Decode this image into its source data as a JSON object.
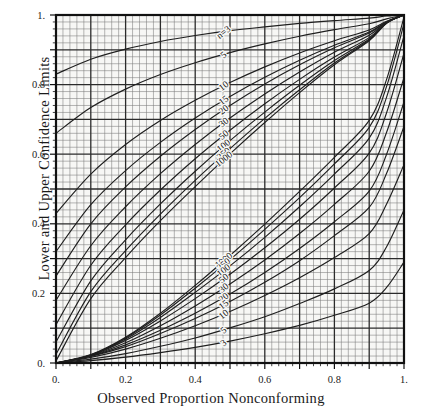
{
  "chart_data": {
    "type": "line",
    "title": "",
    "xlabel": "Observed Proportion Nonconforming",
    "ylabel": "Lower and Upper Confidence Limits",
    "xlim": [
      0,
      1
    ],
    "ylim": [
      0,
      1
    ],
    "grid": true,
    "grid_major_step": 0.1,
    "grid_minor_step": 0.02,
    "legend_position": "inline-curve-labels",
    "xticks": [
      0,
      0.2,
      0.4,
      0.6,
      0.8,
      1
    ],
    "yticks": [
      0,
      0.2,
      0.4,
      0.6,
      0.8,
      1
    ],
    "xticklabels": [
      "0.",
      "0.2",
      "0.4",
      "0.6",
      "0.8",
      "1."
    ],
    "yticklabels": [
      "0.",
      "0.2",
      "0.4",
      "0.6",
      "0.8",
      "1."
    ],
    "annotation_prefix": "n=",
    "series": [
      {
        "name": "n=3 upper",
        "n": 3,
        "bound": "upper",
        "label": "n=3",
        "values": [
          0.83,
          0.873,
          0.902,
          0.924,
          0.941,
          0.955,
          0.966,
          0.976,
          0.984,
          0.991,
          0.997,
          1.0
        ]
      },
      {
        "name": "n=5 upper",
        "n": 5,
        "bound": "upper",
        "label": "5",
        "values": [
          0.66,
          0.734,
          0.787,
          0.829,
          0.863,
          0.892,
          0.917,
          0.939,
          0.958,
          0.975,
          0.989,
          1.0
        ]
      },
      {
        "name": "n=10 upper",
        "n": 10,
        "bound": "upper",
        "label": "10",
        "values": [
          0.43,
          0.543,
          0.628,
          0.697,
          0.755,
          0.806,
          0.851,
          0.891,
          0.926,
          0.957,
          0.982,
          1.0
        ]
      },
      {
        "name": "n=15 upper",
        "n": 15,
        "bound": "upper",
        "label": "15",
        "values": [
          0.32,
          0.455,
          0.553,
          0.634,
          0.704,
          0.766,
          0.821,
          0.87,
          0.913,
          0.951,
          0.98,
          1.0
        ]
      },
      {
        "name": "n=20 upper",
        "n": 20,
        "bound": "upper",
        "label": "20",
        "values": [
          0.25,
          0.4,
          0.506,
          0.594,
          0.671,
          0.74,
          0.802,
          0.857,
          0.906,
          0.948,
          0.98,
          1.0
        ]
      },
      {
        "name": "n=30 upper",
        "n": 30,
        "bound": "upper",
        "label": "30",
        "values": [
          0.18,
          0.337,
          0.449,
          0.544,
          0.628,
          0.704,
          0.773,
          0.836,
          0.893,
          0.942,
          0.979,
          1.0
        ]
      },
      {
        "name": "n=50 upper",
        "n": 50,
        "bound": "upper",
        "label": "50",
        "values": [
          0.11,
          0.281,
          0.397,
          0.497,
          0.587,
          0.669,
          0.745,
          0.815,
          0.879,
          0.935,
          0.978,
          1.0
        ]
      },
      {
        "name": "n=100 upper",
        "n": 100,
        "bound": "upper",
        "label": "100",
        "values": [
          0.06,
          0.236,
          0.354,
          0.457,
          0.551,
          0.639,
          0.721,
          0.798,
          0.869,
          0.931,
          0.977,
          1.0
        ]
      },
      {
        "name": "n=250 upper",
        "n": 250,
        "bound": "upper",
        "label": "250",
        "values": [
          0.025,
          0.205,
          0.323,
          0.428,
          0.525,
          0.616,
          0.703,
          0.785,
          0.862,
          0.928,
          0.977,
          1.0
        ]
      },
      {
        "name": "n=1000 upper",
        "n": 1000,
        "bound": "upper",
        "label": "1000",
        "values": [
          0.006,
          0.185,
          0.303,
          0.409,
          0.507,
          0.601,
          0.691,
          0.777,
          0.857,
          0.926,
          0.976,
          1.0
        ]
      },
      {
        "name": "n=1000 lower",
        "n": 1000,
        "bound": "lower",
        "label": "1000",
        "values": [
          0.0,
          0.024,
          0.074,
          0.143,
          0.223,
          0.309,
          0.399,
          0.493,
          0.591,
          0.697,
          0.815,
          0.994
        ]
      },
      {
        "name": "n=250 lower",
        "n": 250,
        "bound": "lower",
        "label": "250",
        "values": [
          0.0,
          0.023,
          0.072,
          0.138,
          0.215,
          0.297,
          0.384,
          0.475,
          0.572,
          0.677,
          0.795,
          0.975
        ]
      },
      {
        "name": "n=100 lower",
        "n": 100,
        "bound": "lower",
        "label": "100",
        "values": [
          0.0,
          0.023,
          0.069,
          0.131,
          0.203,
          0.279,
          0.361,
          0.449,
          0.543,
          0.646,
          0.764,
          0.94
        ]
      },
      {
        "name": "n=50 lower",
        "n": 50,
        "bound": "lower",
        "label": "50",
        "values": [
          0.0,
          0.022,
          0.065,
          0.121,
          0.185,
          0.255,
          0.331,
          0.413,
          0.503,
          0.603,
          0.719,
          0.89
        ]
      },
      {
        "name": "n=30 lower",
        "n": 30,
        "bound": "lower",
        "label": "30",
        "values": [
          0.0,
          0.021,
          0.058,
          0.107,
          0.164,
          0.227,
          0.296,
          0.372,
          0.456,
          0.551,
          0.663,
          0.82
        ]
      },
      {
        "name": "n=20 lower",
        "n": 20,
        "bound": "lower",
        "label": "20",
        "values": [
          0.0,
          0.02,
          0.052,
          0.094,
          0.143,
          0.198,
          0.26,
          0.329,
          0.406,
          0.494,
          0.6,
          0.75
        ]
      },
      {
        "name": "n=15 lower",
        "n": 15,
        "bound": "lower",
        "label": "15",
        "values": [
          0.0,
          0.019,
          0.047,
          0.085,
          0.128,
          0.177,
          0.232,
          0.294,
          0.366,
          0.447,
          0.545,
          0.68
        ]
      },
      {
        "name": "n=10 lower",
        "n": 10,
        "bound": "lower",
        "label": "10",
        "values": [
          0.0,
          0.016,
          0.04,
          0.071,
          0.107,
          0.148,
          0.194,
          0.245,
          0.303,
          0.372,
          0.457,
          0.57
        ]
      },
      {
        "name": "n=5 lower",
        "n": 5,
        "bound": "lower",
        "label": "5",
        "values": [
          0.0,
          0.011,
          0.027,
          0.048,
          0.072,
          0.101,
          0.133,
          0.171,
          0.213,
          0.266,
          0.334,
          0.44
        ]
      },
      {
        "name": "n=3 lower",
        "n": 3,
        "bound": "lower",
        "label": "3",
        "values": [
          0.0,
          0.007,
          0.017,
          0.03,
          0.045,
          0.063,
          0.084,
          0.108,
          0.137,
          0.172,
          0.217,
          0.29
        ]
      }
    ],
    "x": [
      0,
      0.1,
      0.2,
      0.3,
      0.4,
      0.5,
      0.6,
      0.7,
      0.8,
      0.9,
      0.95,
      1.0
    ],
    "curve_labels_upper": [
      "n=3",
      "5",
      "10",
      "15",
      "20",
      "30",
      "50",
      "100",
      "250",
      "1000"
    ],
    "curve_labels_lower": [
      "1000",
      "250",
      "100",
      "50",
      "30",
      "20",
      "15",
      "10",
      "5",
      "3"
    ]
  },
  "colors": {
    "grid_minor": "#7a7a7a",
    "grid_major": "#2b2b2b",
    "curve": "#1f1f1f",
    "frame": "#111111",
    "background": "#f7f7f5",
    "text": "#1a1a1a"
  }
}
